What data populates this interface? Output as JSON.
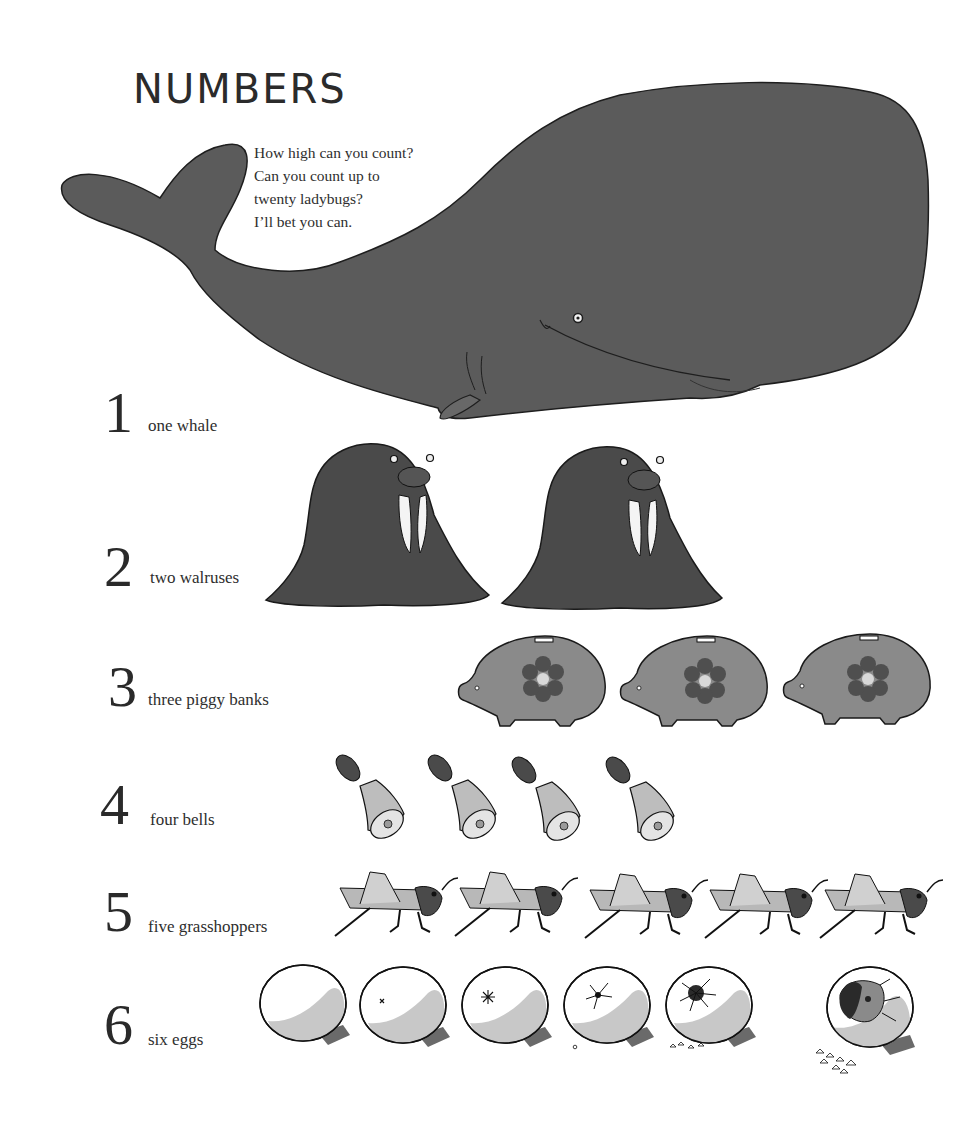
{
  "page": {
    "title": "NUMBERS",
    "intro_lines": [
      "How high can you count?",
      "Can you count up to",
      "twenty ladybugs?",
      "I’ll bet you can."
    ]
  },
  "rows": [
    {
      "numeral": "1",
      "label": "one whale",
      "count": 1,
      "icon": "whale-icon"
    },
    {
      "numeral": "2",
      "label": "two walruses",
      "count": 2,
      "icon": "walrus-icon"
    },
    {
      "numeral": "3",
      "label": "three piggy banks",
      "count": 3,
      "icon": "piggy-bank-icon"
    },
    {
      "numeral": "4",
      "label": "four bells",
      "count": 4,
      "icon": "bell-icon"
    },
    {
      "numeral": "5",
      "label": "five grasshoppers",
      "count": 5,
      "icon": "grasshopper-icon"
    },
    {
      "numeral": "6",
      "label": "six eggs",
      "count": 6,
      "icon": "egg-icon"
    }
  ],
  "colors": {
    "whale": "#5a5a5a",
    "walrus": "#4a4a4a",
    "piggy": "#8a8a8a",
    "flower": "#4f4f4f",
    "ink": "#222222",
    "egg_shade": "#c8c8c8"
  }
}
